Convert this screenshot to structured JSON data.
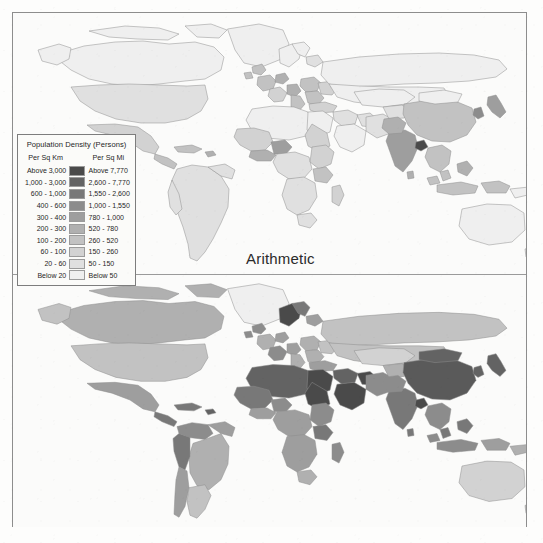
{
  "figure": {
    "panels": [
      {
        "id": "arithmetic",
        "caption": "Arithmetic"
      },
      {
        "id": "physiological",
        "caption": "Physiological"
      }
    ]
  },
  "legend": {
    "title": "Population Density (Persons)",
    "header_left": "Per Sq Km",
    "header_right": "Per Sq Mi",
    "rows": [
      {
        "km": "Above 3,000",
        "mi": "Above 7,770",
        "color": "#4a4a4a"
      },
      {
        "km": "1,000 - 3,000",
        "mi": "2,600 - 7,770",
        "color": "#636363"
      },
      {
        "km": "600 - 1,000",
        "mi": "1,550 - 2,600",
        "color": "#787878"
      },
      {
        "km": "400 - 600",
        "mi": "1,000 - 1,550",
        "color": "#8c8c8c"
      },
      {
        "km": "300 - 400",
        "mi": "780 - 1,000",
        "color": "#9e9e9e"
      },
      {
        "km": "200 - 300",
        "mi": "520 - 780",
        "color": "#b0b0b0"
      },
      {
        "km": "100 - 200",
        "mi": "260 - 520",
        "color": "#c2c2c2"
      },
      {
        "km": "60 - 100",
        "mi": "150 - 260",
        "color": "#d2d2d2"
      },
      {
        "km": "20 - 60",
        "mi": "50 - 150",
        "color": "#e0e0e0"
      },
      {
        "km": "Below 20",
        "mi": "Below 50",
        "color": "#efefef"
      }
    ]
  },
  "map_style": {
    "ocean": "#fbfbfa",
    "country_outline": "#8e8e8e",
    "frame": "#8d8d8d"
  },
  "chart_data": {
    "type": "heatmap",
    "legend_position": "upper-left-overlay",
    "units": {
      "left_column": "Per Sq Km",
      "right_column": "Per Sq Mi"
    },
    "class_breaks_per_sq_km": [
      "Below 20",
      "20 - 60",
      "60 - 100",
      "100 - 200",
      "200 - 300",
      "300 - 400",
      "400 - 600",
      "600 - 1,000",
      "1,000 - 3,000",
      "Above 3,000"
    ],
    "class_breaks_per_sq_mi": [
      "Below 50",
      "50 - 150",
      "150 - 260",
      "260 - 520",
      "520 - 780",
      "780 - 1,000",
      "1,000 - 1,550",
      "1,550 - 2,600",
      "2,600 - 7,770",
      "Above 7,770"
    ],
    "panels": [
      {
        "name": "Arithmetic",
        "description": "Population divided by total land area",
        "regions": [
          {
            "name": "Canada",
            "class": "Below 20"
          },
          {
            "name": "United States",
            "class": "20 - 60"
          },
          {
            "name": "Mexico",
            "class": "60 - 100"
          },
          {
            "name": "Greenland",
            "class": "Below 20"
          },
          {
            "name": "Brazil",
            "class": "20 - 60"
          },
          {
            "name": "Argentina",
            "class": "Below 20"
          },
          {
            "name": "Colombia",
            "class": "20 - 60"
          },
          {
            "name": "United Kingdom",
            "class": "200 - 300"
          },
          {
            "name": "Germany",
            "class": "200 - 300"
          },
          {
            "name": "France",
            "class": "100 - 200"
          },
          {
            "name": "Italy",
            "class": "200 - 300"
          },
          {
            "name": "Spain",
            "class": "60 - 100"
          },
          {
            "name": "Poland",
            "class": "100 - 200"
          },
          {
            "name": "Russia",
            "class": "Below 20"
          },
          {
            "name": "Nigeria",
            "class": "100 - 200"
          },
          {
            "name": "Egypt",
            "class": "60 - 100"
          },
          {
            "name": "Algeria",
            "class": "Below 20"
          },
          {
            "name": "Libya",
            "class": "Below 20"
          },
          {
            "name": "Ethiopia",
            "class": "60 - 100"
          },
          {
            "name": "Kenya",
            "class": "60 - 100"
          },
          {
            "name": "South Africa",
            "class": "20 - 60"
          },
          {
            "name": "Saudi Arabia",
            "class": "Below 20"
          },
          {
            "name": "India",
            "class": "300 - 400"
          },
          {
            "name": "Bangladesh",
            "class": "Above 3,000"
          },
          {
            "name": "Pakistan",
            "class": "200 - 300"
          },
          {
            "name": "China",
            "class": "100 - 200"
          },
          {
            "name": "Mongolia",
            "class": "Below 20"
          },
          {
            "name": "Japan",
            "class": "300 - 400"
          },
          {
            "name": "South Korea",
            "class": "400 - 600"
          },
          {
            "name": "Vietnam",
            "class": "200 - 300"
          },
          {
            "name": "Philippines",
            "class": "200 - 300"
          },
          {
            "name": "Indonesia",
            "class": "100 - 200"
          },
          {
            "name": "Australia",
            "class": "Below 20"
          },
          {
            "name": "Kazakhstan",
            "class": "Below 20"
          }
        ]
      },
      {
        "name": "Physiological",
        "description": "Population divided by arable land area",
        "regions": [
          {
            "name": "Canada",
            "class": "20 - 60"
          },
          {
            "name": "United States",
            "class": "100 - 200"
          },
          {
            "name": "Mexico",
            "class": "300 - 400"
          },
          {
            "name": "Greenland",
            "class": "Below 20"
          },
          {
            "name": "Brazil",
            "class": "200 - 300"
          },
          {
            "name": "Argentina",
            "class": "60 - 100"
          },
          {
            "name": "Colombia",
            "class": "400 - 600"
          },
          {
            "name": "Peru",
            "class": "600 - 1,000"
          },
          {
            "name": "United Kingdom",
            "class": "400 - 600"
          },
          {
            "name": "Germany",
            "class": "300 - 400"
          },
          {
            "name": "France",
            "class": "200 - 300"
          },
          {
            "name": "Italy",
            "class": "400 - 600"
          },
          {
            "name": "Spain",
            "class": "200 - 300"
          },
          {
            "name": "Norway",
            "class": "Above 3,000"
          },
          {
            "name": "Russia",
            "class": "100 - 200"
          },
          {
            "name": "Nigeria",
            "class": "300 - 400"
          },
          {
            "name": "Egypt",
            "class": "Above 3,000"
          },
          {
            "name": "Algeria",
            "class": "1,000 - 3,000"
          },
          {
            "name": "Libya",
            "class": "Above 3,000"
          },
          {
            "name": "Ethiopia",
            "class": "400 - 600"
          },
          {
            "name": "Kenya",
            "class": "600 - 1,000"
          },
          {
            "name": "South Africa",
            "class": "200 - 300"
          },
          {
            "name": "Saudi Arabia",
            "class": "Above 3,000"
          },
          {
            "name": "India",
            "class": "600 - 1,000"
          },
          {
            "name": "Bangladesh",
            "class": "Above 3,000"
          },
          {
            "name": "Pakistan",
            "class": "400 - 600"
          },
          {
            "name": "China",
            "class": "1,000 - 3,000"
          },
          {
            "name": "Mongolia",
            "class": "1,000 - 3,000"
          },
          {
            "name": "Japan",
            "class": "1,000 - 3,000"
          },
          {
            "name": "South Korea",
            "class": "1,000 - 3,000"
          },
          {
            "name": "Vietnam",
            "class": "600 - 1,000"
          },
          {
            "name": "Indonesia",
            "class": "600 - 1,000"
          },
          {
            "name": "Australia",
            "class": "60 - 100"
          },
          {
            "name": "Kazakhstan",
            "class": "60 - 100"
          }
        ]
      }
    ]
  }
}
